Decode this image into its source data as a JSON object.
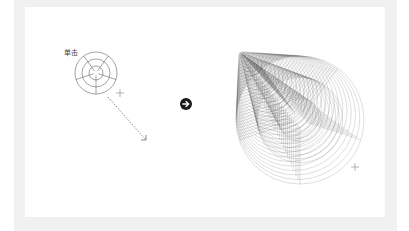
{
  "diagram": {
    "left_label": "单击",
    "before": {
      "type": "polar-grid",
      "center": [
        96,
        73
      ],
      "radii": [
        7,
        14,
        21
      ],
      "spokes": 5,
      "stroke": "#666666"
    },
    "cursor_start": [
      120,
      93
    ],
    "drag_path": {
      "from": [
        108,
        97
      ],
      "to": [
        146,
        140
      ],
      "style": "dashed"
    },
    "transition_icon": {
      "name": "arrow-right-circle",
      "center": [
        186,
        104
      ],
      "radius": 6,
      "fill": "#1a1a1a",
      "glyph_color": "#ffffff"
    },
    "after": {
      "type": "swept-polar-grid",
      "anchor": [
        242,
        55
      ],
      "end": [
        300,
        120
      ],
      "steps": 28,
      "stroke": "#555555"
    },
    "cursor_end": [
      355,
      167
    ]
  },
  "colors": {
    "background": "#ffffff",
    "frame": "#f1f1f1",
    "line": "#666666",
    "icon": "#1a1a1a"
  }
}
